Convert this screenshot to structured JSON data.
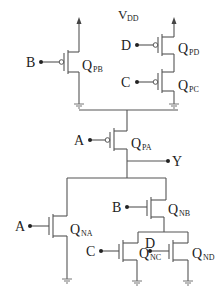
{
  "supply": {
    "label": "V",
    "sub": "DD"
  },
  "output": {
    "label": "Y"
  },
  "transistors": [
    {
      "id": "QPB",
      "type": "pmos",
      "gate": "B",
      "label": "Q",
      "sub": "PB"
    },
    {
      "id": "QPD",
      "type": "pmos",
      "gate": "D",
      "label": "Q",
      "sub": "PD"
    },
    {
      "id": "QPC",
      "type": "pmos",
      "gate": "C",
      "label": "Q",
      "sub": "PC"
    },
    {
      "id": "QPA",
      "type": "pmos",
      "gate": "A",
      "label": "Q",
      "sub": "PA"
    },
    {
      "id": "QNA",
      "type": "nmos",
      "gate": "A",
      "label": "Q",
      "sub": "NA"
    },
    {
      "id": "QNB",
      "type": "nmos",
      "gate": "B",
      "label": "Q",
      "sub": "NB"
    },
    {
      "id": "QNC",
      "type": "nmos",
      "gate": "C",
      "label": "Q",
      "sub": "NC"
    },
    {
      "id": "QND",
      "type": "nmos",
      "gate": "D",
      "label": "Q",
      "sub": "ND"
    }
  ],
  "inputs": {
    "pb": "B",
    "pd": "D",
    "pc": "C",
    "pa": "A",
    "na": "A",
    "nb": "B",
    "nc": "C",
    "nd": "D"
  }
}
